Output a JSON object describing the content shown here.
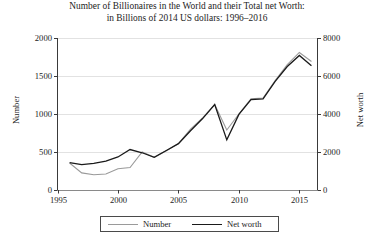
{
  "title": {
    "line1": "Number of Billionaires in the World and their Total net Worth:",
    "line2": "in Billions of 2014 US dollars: 1996–2016"
  },
  "axes": {
    "y_left_title": "Number",
    "y_right_title": "Net worth",
    "y_left_ticks": [
      "0",
      "500",
      "1000",
      "1500",
      "2000"
    ],
    "y_right_ticks": [
      "0",
      "2000",
      "4000",
      "6000",
      "8000"
    ],
    "x_ticks": [
      "1995",
      "2000",
      "2005",
      "2010",
      "2015"
    ]
  },
  "legend": {
    "number_label": "Number",
    "networth_label": "Net worth",
    "number_color": "#9a9a9a",
    "networth_color": "#1a1a1a"
  },
  "caption_fragment": "",
  "chart_data": {
    "type": "line",
    "title": "Number of Billionaires in the World and their Total net Worth: in Billions of 2014 US dollars: 1996–2016",
    "xlabel": "",
    "ylabel": "Number",
    "y2label": "Net worth",
    "xlim": [
      1995,
      2016.5
    ],
    "ylim": [
      0,
      2000
    ],
    "y2lim": [
      0,
      8000
    ],
    "grid": "horizontal",
    "legend_position": "below-axes",
    "x": [
      1996,
      1997,
      1998,
      1999,
      2000,
      2001,
      2002,
      2003,
      2004,
      2005,
      2006,
      2007,
      2008,
      2009,
      2010,
      2011,
      2012,
      2013,
      2014,
      2015,
      2016
    ],
    "series": [
      {
        "name": "Number",
        "axis": "left",
        "color": "#9a9a9a",
        "values": [
          355,
          225,
          200,
          210,
          280,
          295,
          500,
          430,
          515,
          610,
          800,
          950,
          1125,
          790,
          1000,
          1200,
          1210,
          1440,
          1650,
          1810,
          1690
        ]
      },
      {
        "name": "Net worth",
        "axis": "right",
        "color": "#1a1a1a",
        "values": [
          1440,
          1340,
          1400,
          1520,
          1740,
          2130,
          1960,
          1720,
          2080,
          2440,
          3120,
          3760,
          4500,
          2640,
          3980,
          4760,
          4800,
          5720,
          6500,
          7080,
          6540
        ]
      }
    ]
  }
}
